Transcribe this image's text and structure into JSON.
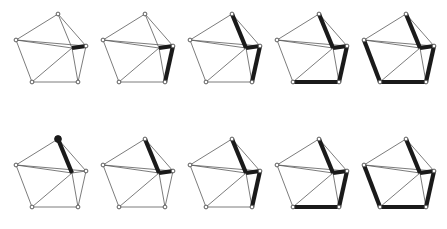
{
  "figure": {
    "rows": 2,
    "columns": 5,
    "background_color": "#ffffff",
    "thin_edge_color": "#5a5a5a",
    "thick_edge_color": "#1a1a1a",
    "vertex_open_fill": "#ffffff",
    "vertex_stroke_color": "#4a4a4a",
    "vertex_filled_color": "#1a1a1a"
  },
  "graph": {
    "vertex_ids": [
      "v_top",
      "v_left",
      "v_bottom_left",
      "v_bottom_right",
      "v_right",
      "v_center"
    ],
    "vertex_positions": {
      "v_top": {
        "x": 58,
        "y": 14
      },
      "v_left": {
        "x": 16,
        "y": 40
      },
      "v_bottom_left": {
        "x": 32,
        "y": 82
      },
      "v_bottom_right": {
        "x": 78,
        "y": 82
      },
      "v_right": {
        "x": 86,
        "y": 46
      },
      "v_center": {
        "x": 72,
        "y": 48
      }
    },
    "edges": [
      {
        "id": "e1",
        "from": "v_top",
        "to": "v_left"
      },
      {
        "id": "e2",
        "from": "v_left",
        "to": "v_bottom_left"
      },
      {
        "id": "e3",
        "from": "v_bottom_left",
        "to": "v_bottom_right"
      },
      {
        "id": "e4",
        "from": "v_bottom_right",
        "to": "v_right"
      },
      {
        "id": "e5",
        "from": "v_right",
        "to": "v_top"
      },
      {
        "id": "e6",
        "from": "v_top",
        "to": "v_center"
      },
      {
        "id": "e7",
        "from": "v_left",
        "to": "v_center"
      },
      {
        "id": "e8",
        "from": "v_bottom_left",
        "to": "v_center"
      },
      {
        "id": "e9",
        "from": "v_bottom_right",
        "to": "v_center"
      },
      {
        "id": "e10",
        "from": "v_left",
        "to": "v_right"
      },
      {
        "id": "e11",
        "from": "v_center",
        "to": "v_right"
      }
    ]
  },
  "panels": [
    {
      "row": "top",
      "index": 1,
      "label": "top-panel-1",
      "thick_edges": [
        "e11"
      ],
      "filled_vertices": []
    },
    {
      "row": "top",
      "index": 2,
      "label": "top-panel-2",
      "thick_edges": [
        "e11",
        "e4"
      ],
      "filled_vertices": []
    },
    {
      "row": "top",
      "index": 3,
      "label": "top-panel-3",
      "thick_edges": [
        "e11",
        "e4",
        "e6"
      ],
      "filled_vertices": []
    },
    {
      "row": "top",
      "index": 4,
      "label": "top-panel-4",
      "thick_edges": [
        "e11",
        "e4",
        "e6",
        "e3"
      ],
      "filled_vertices": []
    },
    {
      "row": "top",
      "index": 5,
      "label": "top-panel-5",
      "thick_edges": [
        "e11",
        "e4",
        "e6",
        "e3",
        "e2"
      ],
      "filled_vertices": []
    },
    {
      "row": "bottom",
      "index": 1,
      "label": "bottom-panel-1",
      "thick_edges": [
        "e6"
      ],
      "filled_vertices": [
        "v_top"
      ]
    },
    {
      "row": "bottom",
      "index": 2,
      "label": "bottom-panel-2",
      "thick_edges": [
        "e6",
        "e11"
      ],
      "filled_vertices": []
    },
    {
      "row": "bottom",
      "index": 3,
      "label": "bottom-panel-3",
      "thick_edges": [
        "e6",
        "e11",
        "e4"
      ],
      "filled_vertices": []
    },
    {
      "row": "bottom",
      "index": 4,
      "label": "bottom-panel-4",
      "thick_edges": [
        "e6",
        "e11",
        "e4",
        "e3"
      ],
      "filled_vertices": []
    },
    {
      "row": "bottom",
      "index": 5,
      "label": "bottom-panel-5",
      "thick_edges": [
        "e6",
        "e11",
        "e4",
        "e3",
        "e2"
      ],
      "filled_vertices": []
    }
  ]
}
